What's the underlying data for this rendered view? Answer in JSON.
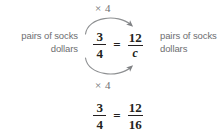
{
  "diagram": {
    "colors": {
      "label_gray": "#6d6e71",
      "math_black": "#231f20",
      "arrow_gray": "#808285",
      "background": "#ffffff"
    },
    "left_label": {
      "line1": "pairs of socks",
      "line2": "dollars"
    },
    "right_label": {
      "line1": "pairs of socks",
      "line2": "dollars"
    },
    "multiplier_top": "× 4",
    "multiplier_bottom": "× 4",
    "equation_main": {
      "left_fraction": {
        "numerator": "3",
        "denominator": "4"
      },
      "relation": "=",
      "right_fraction": {
        "numerator": "12",
        "denominator": "c"
      }
    },
    "equation_solved": {
      "left_fraction": {
        "numerator": "3",
        "denominator": "4"
      },
      "relation": "=",
      "right_fraction": {
        "numerator": "12",
        "denominator": "16"
      }
    },
    "arrows": {
      "top": "curved-arrow-right-over-numerators",
      "bottom": "curved-arrow-right-under-denominators"
    }
  }
}
